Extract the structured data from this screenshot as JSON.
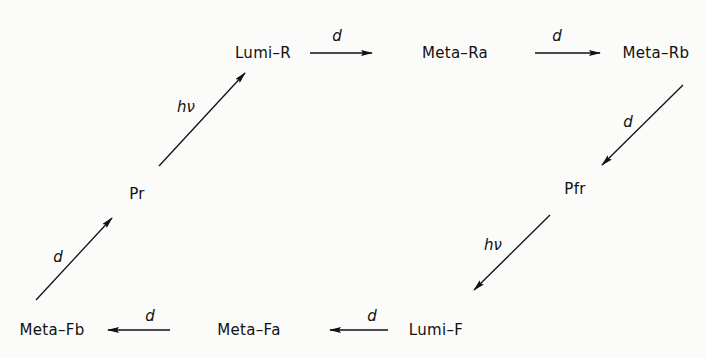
{
  "diagram": {
    "type": "reaction-cycle",
    "nodes": [
      {
        "id": "lumi_r",
        "label": "Lumi–R",
        "x": 263,
        "y": 53
      },
      {
        "id": "meta_ra",
        "label": "Meta–Ra",
        "x": 455,
        "y": 53
      },
      {
        "id": "meta_rb",
        "label": "Meta–Rb",
        "x": 656,
        "y": 53
      },
      {
        "id": "pfr",
        "label": "Pfr",
        "x": 575,
        "y": 189
      },
      {
        "id": "lumi_f",
        "label": "Lumi–F",
        "x": 436,
        "y": 330
      },
      {
        "id": "meta_fa",
        "label": "Meta–Fa",
        "x": 249,
        "y": 330
      },
      {
        "id": "meta_fb",
        "label": "Meta–Fb",
        "x": 52,
        "y": 330
      },
      {
        "id": "pr",
        "label": "Pr",
        "x": 137,
        "y": 194
      }
    ],
    "edges": [
      {
        "from": "pr",
        "to": "lumi_r",
        "label": "hν",
        "x1": 159,
        "y1": 166,
        "x2": 245,
        "y2": 73,
        "lx": 186,
        "ly": 107
      },
      {
        "from": "lumi_r",
        "to": "meta_ra",
        "label": "d",
        "x1": 310,
        "y1": 53,
        "x2": 372,
        "y2": 53,
        "lx": 337,
        "ly": 36
      },
      {
        "from": "meta_ra",
        "to": "meta_rb",
        "label": "d",
        "x1": 535,
        "y1": 53,
        "x2": 600,
        "y2": 53,
        "lx": 557,
        "ly": 36
      },
      {
        "from": "meta_rb",
        "to": "pfr",
        "label": "d",
        "x1": 683,
        "y1": 85,
        "x2": 602,
        "y2": 165,
        "lx": 628,
        "ly": 122
      },
      {
        "from": "pfr",
        "to": "lumi_f",
        "label": "hν",
        "x1": 550,
        "y1": 215,
        "x2": 474,
        "y2": 290,
        "lx": 493,
        "ly": 245
      },
      {
        "from": "lumi_f",
        "to": "meta_fa",
        "label": "d",
        "x1": 388,
        "y1": 330,
        "x2": 330,
        "y2": 330,
        "lx": 372,
        "ly": 316
      },
      {
        "from": "meta_fa",
        "to": "meta_fb",
        "label": "d",
        "x1": 170,
        "y1": 330,
        "x2": 108,
        "y2": 330,
        "lx": 150,
        "ly": 316
      },
      {
        "from": "meta_fb",
        "to": "pr",
        "label": "d",
        "x1": 36,
        "y1": 300,
        "x2": 112,
        "y2": 218,
        "lx": 58,
        "ly": 257
      }
    ],
    "colors": {
      "ink": "#111111",
      "background": "#fbfbfa"
    }
  }
}
